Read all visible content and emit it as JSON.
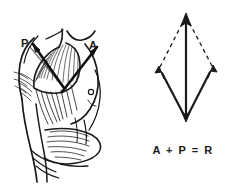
{
  "figure": {
    "background_color": "#ffffff",
    "ink_color": "#1a1a1a",
    "width": 244,
    "height": 185
  },
  "anatomy_panel": {
    "name": "pectoralis-force-illustration",
    "description": "Line drawing of a human torso and shoulder showing pectoralis muscle fibers with two force arrows",
    "labels": [
      {
        "id": "P",
        "text": "P",
        "meaning": "posterior-force-vector"
      },
      {
        "id": "A",
        "text": "A",
        "meaning": "anterior-force-vector"
      }
    ]
  },
  "vector_panel": {
    "name": "vector-parallelogram-diagram",
    "labels": [
      {
        "id": "R",
        "text": "R",
        "meaning": "resultant-vector"
      },
      {
        "id": "P",
        "text": "P",
        "meaning": "posterior-component-vector"
      },
      {
        "id": "A",
        "text": "A",
        "meaning": "anterior-component-vector"
      }
    ],
    "equation": "A + P = R",
    "geometry": {
      "origin": [
        64,
        120
      ],
      "apex": [
        64,
        14
      ],
      "left_vertex": [
        38,
        67
      ],
      "right_vertex": [
        90,
        66
      ],
      "solid_vectors": [
        "origin-to-apex",
        "origin-to-left-vertex",
        "origin-to-right-vertex"
      ],
      "dashed_vectors": [
        "left-vertex-to-apex",
        "right-vertex-to-apex"
      ]
    }
  }
}
